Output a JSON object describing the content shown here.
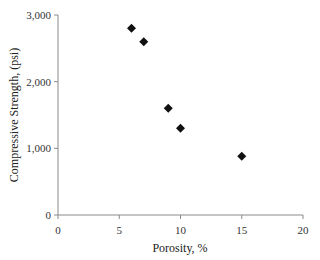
{
  "chart_data": {
    "type": "scatter",
    "title": "",
    "xlabel": "Porosity, %",
    "ylabel": "Compressive Strength, (psi)",
    "xlim": [
      0,
      20
    ],
    "ylim": [
      0,
      3000
    ],
    "x_ticks": [
      0,
      5,
      10,
      15,
      20
    ],
    "x_tick_labels": [
      "0",
      "5",
      "10",
      "15",
      "20"
    ],
    "y_ticks": [
      0,
      1000,
      2000,
      3000
    ],
    "y_tick_labels": [
      "0",
      "1,000",
      "2,000",
      "3,000"
    ],
    "grid": false,
    "legend": null,
    "marker": "diamond",
    "marker_color": "#111111",
    "series": [
      {
        "name": "Compressive Strength vs Porosity",
        "x": [
          6,
          7,
          9,
          10,
          15
        ],
        "y": [
          2800,
          2600,
          1600,
          1300,
          880
        ]
      }
    ]
  }
}
